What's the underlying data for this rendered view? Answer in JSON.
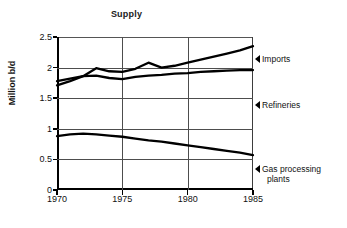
{
  "chart_data": {
    "type": "line",
    "title": "Supply",
    "xlabel": "",
    "ylabel": "Million b/d",
    "xlim": [
      1970,
      1985
    ],
    "ylim": [
      0,
      2.5
    ],
    "ytick_labels": [
      "0",
      "0.5",
      "1",
      "1.5",
      "2",
      "2.5"
    ],
    "ytick_values": [
      0,
      0.5,
      1,
      1.5,
      2,
      2.5
    ],
    "xtick_labels": [
      "1970",
      "1975",
      "1980",
      "1985"
    ],
    "xtick_values": [
      1970,
      1975,
      1980,
      1985
    ],
    "grid": "both",
    "legend_position": "right-inline-callouts",
    "series": [
      {
        "name": "Imports",
        "x": [
          1970,
          1971,
          1972,
          1973,
          1974,
          1975,
          1976,
          1977,
          1978,
          1979,
          1980,
          1981,
          1982,
          1983,
          1984,
          1985
        ],
        "values": [
          1.71,
          1.78,
          1.86,
          1.99,
          1.94,
          1.93,
          1.98,
          2.08,
          2.0,
          2.03,
          2.08,
          2.13,
          2.18,
          2.23,
          2.28,
          2.35
        ]
      },
      {
        "name": "Refineries",
        "x": [
          1970,
          1971,
          1972,
          1973,
          1974,
          1975,
          1976,
          1977,
          1978,
          1979,
          1980,
          1981,
          1982,
          1983,
          1984,
          1985
        ],
        "values": [
          1.78,
          1.82,
          1.86,
          1.87,
          1.83,
          1.81,
          1.85,
          1.87,
          1.88,
          1.9,
          1.91,
          1.93,
          1.94,
          1.95,
          1.96,
          1.96
        ]
      },
      {
        "name": "Gas processing plants",
        "x": [
          1970,
          1971,
          1972,
          1973,
          1974,
          1975,
          1976,
          1977,
          1978,
          1979,
          1980,
          1981,
          1982,
          1983,
          1984,
          1985
        ],
        "values": [
          0.88,
          0.91,
          0.92,
          0.91,
          0.89,
          0.87,
          0.84,
          0.81,
          0.79,
          0.76,
          0.73,
          0.7,
          0.67,
          0.64,
          0.61,
          0.57
        ]
      }
    ]
  },
  "callouts": {
    "imports": {
      "label": "Imports",
      "value_at_marker": 2.12
    },
    "refineries": {
      "label": "Refineries",
      "value_at_marker": 1.38
    },
    "gas_line1": "Gas processing",
    "gas_line2": "plants"
  },
  "colors": {
    "line": "#000000",
    "grid": "#4d4d4d",
    "axis": "#000000",
    "text": "#111111",
    "background": "#ffffff"
  }
}
